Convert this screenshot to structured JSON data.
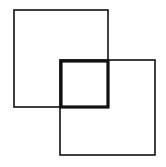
{
  "diagram": {
    "title": "",
    "background": "#ffffff",
    "stroke_color": "#111111",
    "shapes": [
      {
        "id": "square-top-left",
        "x": 14,
        "y": 10,
        "w": 94,
        "h": 97,
        "stroke_width": 1.6
      },
      {
        "id": "square-bottom-right",
        "x": 60,
        "y": 60,
        "w": 95,
        "h": 95,
        "stroke_width": 1.6
      },
      {
        "id": "square-overlap",
        "x": 61,
        "y": 61,
        "w": 47,
        "h": 46,
        "stroke_width": 3.2
      }
    ]
  }
}
